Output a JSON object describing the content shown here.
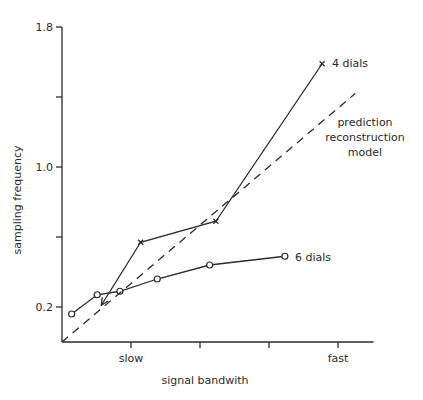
{
  "chart_data": {
    "type": "line",
    "title": "",
    "xlabel": "signal bandwith",
    "ylabel": "sampling frequency",
    "xlim": [
      0,
      4.5
    ],
    "ylim": [
      0,
      1.8
    ],
    "grid": false,
    "x_ticks": [
      {
        "value": 1,
        "label": "slow"
      },
      {
        "value": 2,
        "label": ""
      },
      {
        "value": 3,
        "label": ""
      },
      {
        "value": 4,
        "label": "fast"
      }
    ],
    "y_ticks": [
      {
        "value": 0.2,
        "label": "0.2"
      },
      {
        "value": 0.6,
        "label": ""
      },
      {
        "value": 1.0,
        "label": "1.0"
      },
      {
        "value": 1.4,
        "label": ""
      },
      {
        "value": 1.8,
        "label": "1.8"
      }
    ],
    "series": [
      {
        "name": "4 dials",
        "marker": "cross",
        "line": "solid",
        "start_arrow": true,
        "x": [
          0.57,
          1.14,
          2.23,
          3.77
        ],
        "y": [
          0.21,
          0.57,
          0.69,
          1.59
        ]
      },
      {
        "name": "6 dials",
        "marker": "circle",
        "line": "solid",
        "x": [
          0.14,
          0.51,
          0.84,
          1.38,
          2.14,
          3.23
        ],
        "y": [
          0.16,
          0.27,
          0.29,
          0.36,
          0.44,
          0.49
        ]
      },
      {
        "name": "prediction reconstruction model",
        "label_lines": [
          "prediction",
          "reconstruction",
          "model"
        ],
        "marker": "none",
        "line": "dashed",
        "x": [
          0.0,
          4.25
        ],
        "y": [
          0.0,
          1.42
        ]
      }
    ]
  }
}
